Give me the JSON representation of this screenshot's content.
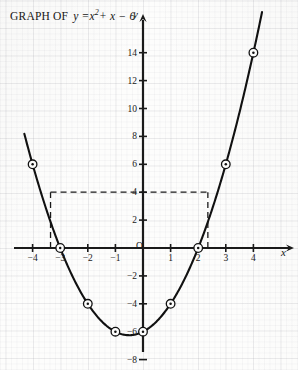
{
  "title": {
    "prefix": "GRAPH OF",
    "equation_plain": "y = x^2 + x - 6",
    "lhs": "y =",
    "base": "x",
    "exponent": "2",
    "tail": "+ x − 6"
  },
  "axes": {
    "x_label": "x",
    "y_label": "y",
    "origin_label": "O",
    "x_ticks": [
      {
        "value": -4,
        "label": "−4"
      },
      {
        "value": -3,
        "label": "−3"
      },
      {
        "value": -2,
        "label": "−2"
      },
      {
        "value": -1,
        "label": "−1"
      },
      {
        "value": 1,
        "label": "1"
      },
      {
        "value": 2,
        "label": "2"
      },
      {
        "value": 3,
        "label": "3"
      },
      {
        "value": 4,
        "label": "4"
      }
    ],
    "y_ticks": [
      {
        "value": 14,
        "label": "14"
      },
      {
        "value": 12,
        "label": "12"
      },
      {
        "value": 10,
        "label": "10"
      },
      {
        "value": 8,
        "label": "8"
      },
      {
        "value": 6,
        "label": "6"
      },
      {
        "value": 4,
        "label": "4"
      },
      {
        "value": 2,
        "label": "2"
      },
      {
        "value": -2,
        "label": "−2"
      },
      {
        "value": -4,
        "label": "−4"
      },
      {
        "value": -6,
        "label": "−6"
      },
      {
        "value": -8,
        "label": "−8"
      }
    ]
  },
  "chart_data": {
    "type": "line",
    "xlabel": "x",
    "ylabel": "y",
    "xlim": [
      -4.3,
      4.4
    ],
    "ylim": [
      -8,
      15.5
    ],
    "grid": true,
    "legend": "none",
    "function": "y = x^2 + x - 6",
    "roots": [
      -3,
      2
    ],
    "vertex": [
      -0.5,
      -6.25
    ],
    "y_intercept": -6,
    "x": [
      -4,
      -3,
      -2,
      -1,
      0,
      1,
      2,
      3,
      4
    ],
    "values": [
      6,
      0,
      -4,
      -6,
      -6,
      -4,
      0,
      6,
      14
    ],
    "plotted_points": [
      {
        "x": -4,
        "y": 6
      },
      {
        "x": -3,
        "y": 0
      },
      {
        "x": -2,
        "y": -4
      },
      {
        "x": -1,
        "y": -6
      },
      {
        "x": 0,
        "y": -6
      },
      {
        "x": 1,
        "y": -4
      },
      {
        "x": 2,
        "y": 0
      },
      {
        "x": 3,
        "y": 6
      },
      {
        "x": 4,
        "y": 14
      }
    ],
    "annotations": [
      {
        "type": "dashed-guide",
        "label": "y = 4 horizontal guide",
        "y": 4,
        "x_from": -3.35,
        "x_to": 2.35
      },
      {
        "type": "dashed-guide",
        "label": "left solution vertical drop",
        "x": -3.35,
        "y_from": 0,
        "y_to": 4
      },
      {
        "type": "dashed-guide",
        "label": "right solution vertical drop",
        "x": 2.35,
        "y_from": 0,
        "y_to": 4
      }
    ]
  },
  "colors": {
    "curve": "#111111",
    "axis": "#1a1a1a",
    "guide": "#1a1a1a",
    "grid": "#9696a0",
    "background": "#fdfdfc"
  }
}
